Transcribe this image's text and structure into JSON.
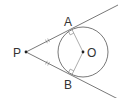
{
  "diagram": {
    "type": "geometry",
    "labels": {
      "P": "P",
      "O": "O",
      "A": "A",
      "B": "B"
    },
    "points": {
      "P": [
        26,
        52
      ],
      "O": [
        83,
        52
      ],
      "A": [
        72,
        29
      ],
      "B": [
        72,
        75
      ]
    },
    "circle": {
      "center": "O",
      "radius": 25
    },
    "marks": {
      "equal_ticks": [
        "PA",
        "PB"
      ],
      "right_angles": [
        "OAP",
        "OBP"
      ]
    },
    "colors": {
      "line": "#555555",
      "text": "#333333",
      "background": "#ffffff"
    }
  }
}
